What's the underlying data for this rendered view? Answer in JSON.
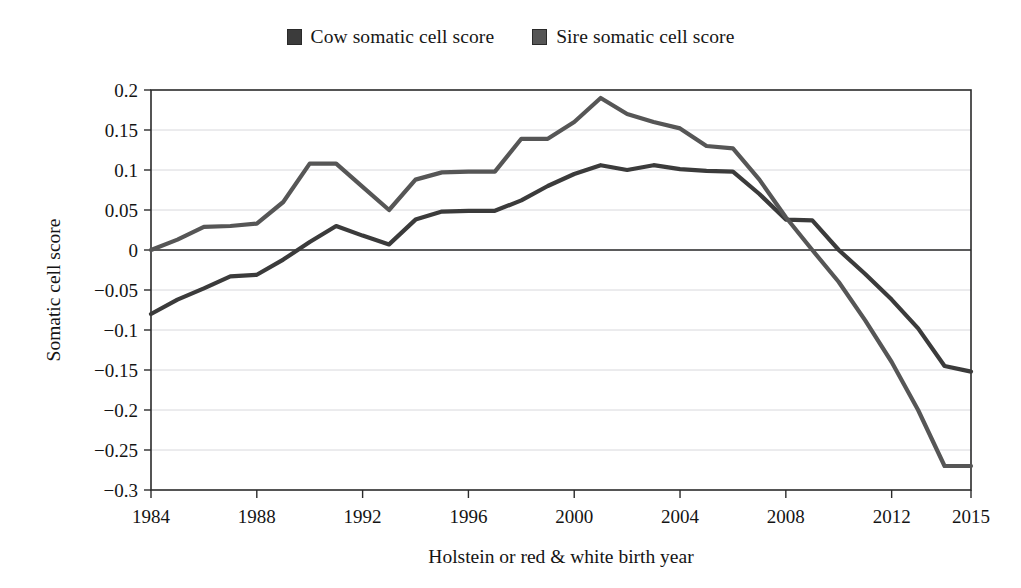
{
  "legend": {
    "position": "top-center",
    "entries": [
      {
        "label": "Cow somatic cell score",
        "color": "#3b3b3b",
        "marker": "square-icon"
      },
      {
        "label": "Sire somatic cell score",
        "color": "#565656",
        "marker": "square-icon"
      }
    ]
  },
  "chart_data": {
    "type": "line",
    "title": "",
    "subtitle": "",
    "xlabel": "Holstein or red & white birth year",
    "ylabel": "Somatic cell score",
    "xlim": [
      1984,
      2015
    ],
    "ylim": [
      -0.3,
      0.2
    ],
    "grid": true,
    "xticks": [
      1984,
      1988,
      1992,
      1996,
      2000,
      2004,
      2008,
      2012,
      2015
    ],
    "xticklabels": [
      "1984",
      "1988",
      "1992",
      "1996",
      "2000",
      "2004",
      "2008",
      "2012",
      "2015"
    ],
    "yticks": [
      0.2,
      0.15,
      0.1,
      0.05,
      0,
      -0.05,
      -0.1,
      -0.15,
      -0.2,
      -0.25,
      -0.3
    ],
    "yticklabels": [
      "0.2",
      "0.15",
      "0.1",
      "0.05",
      "0",
      "-0.05",
      "-0.1",
      "-0.15",
      "-0.2",
      "-0.25",
      "-0.3"
    ],
    "x": [
      1984,
      1985,
      1986,
      1987,
      1988,
      1989,
      1990,
      1991,
      1992,
      1993,
      1994,
      1995,
      1996,
      1997,
      1998,
      1999,
      2000,
      2001,
      2002,
      2003,
      2004,
      2005,
      2006,
      2007,
      2008,
      2009,
      2010,
      2011,
      2012,
      2013,
      2014,
      2015
    ],
    "series": [
      {
        "name": "Cow somatic cell score",
        "color": "#3b3b3b",
        "values": [
          -0.08,
          -0.062,
          -0.048,
          -0.033,
          -0.031,
          -0.012,
          0.01,
          0.03,
          0.018,
          0.007,
          0.038,
          0.048,
          0.049,
          0.049,
          0.062,
          0.08,
          0.095,
          0.106,
          0.1,
          0.106,
          0.101,
          0.099,
          0.098,
          0.07,
          0.038,
          0.037,
          0.0,
          -0.03,
          -0.062,
          -0.098,
          -0.145,
          -0.152
        ]
      },
      {
        "name": "Sire somatic cell score",
        "color": "#565656",
        "values": [
          0.0,
          0.013,
          0.029,
          0.03,
          0.033,
          0.06,
          0.108,
          0.108,
          0.079,
          0.05,
          0.088,
          0.097,
          0.098,
          0.098,
          0.139,
          0.139,
          0.16,
          0.19,
          0.17,
          0.16,
          0.152,
          0.13,
          0.127,
          0.088,
          0.041,
          0.0,
          -0.04,
          -0.088,
          -0.14,
          -0.2,
          -0.27,
          -0.27
        ]
      }
    ],
    "annotations": []
  }
}
